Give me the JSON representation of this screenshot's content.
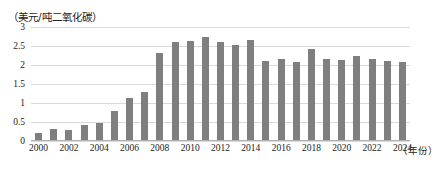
{
  "chart_data": {
    "type": "bar",
    "title": "",
    "subtitle": "",
    "ylabel": "（美元/吨二氧化碳）",
    "xlabel": "（年份）",
    "ylim": [
      0,
      3
    ],
    "yticks": [
      "0",
      "0.5",
      "1",
      "1.5",
      "2",
      "2.5",
      "3"
    ],
    "ytick_values": [
      0,
      0.5,
      1,
      1.5,
      2,
      2.5,
      3
    ],
    "grid": true,
    "legend": "none",
    "bar_color": "#7f7f7f",
    "categories": [
      "2000",
      "2001",
      "2002",
      "2003",
      "2004",
      "2005",
      "2006",
      "2007",
      "2008",
      "2009",
      "2010",
      "2011",
      "2012",
      "2013",
      "2014",
      "2015",
      "2016",
      "2017",
      "2018",
      "2019",
      "2020",
      "2021",
      "2022",
      "2023",
      "2024"
    ],
    "xtick_labels": [
      "2000",
      "2002",
      "2004",
      "2006",
      "2008",
      "2010",
      "2012",
      "2014",
      "2016",
      "2018",
      "2020",
      "2022",
      "2024"
    ],
    "values": [
      0.22,
      0.32,
      0.28,
      0.42,
      0.48,
      0.78,
      1.12,
      1.28,
      2.32,
      2.6,
      2.63,
      2.75,
      2.6,
      2.52,
      2.65,
      2.1,
      2.15,
      2.08,
      2.42,
      2.17,
      2.12,
      2.25,
      2.15,
      2.1,
      2.08
    ]
  }
}
